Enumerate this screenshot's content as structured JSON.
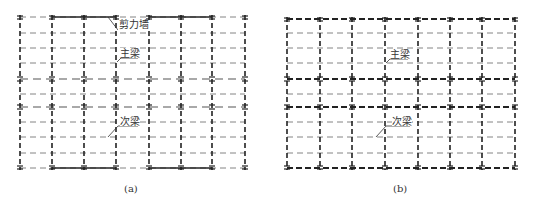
{
  "figures": [
    {
      "id": "a",
      "caption": "(a)",
      "labels": {
        "shear_wall": "剪力墙",
        "main_beam": "主梁",
        "secondary_beam": "次梁"
      }
    },
    {
      "id": "b",
      "caption": "(b)",
      "labels": {
        "main_beam": "主梁",
        "secondary_beam": "次梁"
      }
    }
  ],
  "colors": {
    "line": "#333333",
    "thin_line": "#777777"
  }
}
